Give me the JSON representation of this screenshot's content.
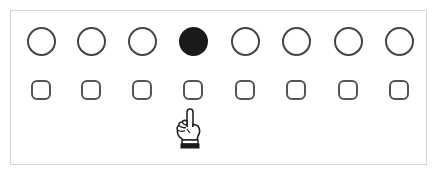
{
  "panel": {
    "border_color": "#d4d4d4"
  },
  "circles": [
    {
      "index": 0,
      "cx": 41,
      "cy": 41,
      "selected": false
    },
    {
      "index": 1,
      "cx": 91,
      "cy": 41,
      "selected": false
    },
    {
      "index": 2,
      "cx": 142,
      "cy": 41,
      "selected": false
    },
    {
      "index": 3,
      "cx": 193,
      "cy": 41,
      "selected": true
    },
    {
      "index": 4,
      "cx": 245,
      "cy": 41,
      "selected": false
    },
    {
      "index": 5,
      "cx": 296,
      "cy": 41,
      "selected": false
    },
    {
      "index": 6,
      "cx": 348,
      "cy": 41,
      "selected": false
    },
    {
      "index": 7,
      "cx": 399,
      "cy": 41,
      "selected": false
    }
  ],
  "squares": [
    {
      "index": 0,
      "cx": 41,
      "cy": 90
    },
    {
      "index": 1,
      "cx": 91,
      "cy": 90
    },
    {
      "index": 2,
      "cx": 142,
      "cy": 90
    },
    {
      "index": 3,
      "cx": 193,
      "cy": 90
    },
    {
      "index": 4,
      "cx": 245,
      "cy": 90
    },
    {
      "index": 5,
      "cx": 296,
      "cy": 90
    },
    {
      "index": 6,
      "cx": 348,
      "cy": 90
    },
    {
      "index": 7,
      "cx": 399,
      "cy": 90
    }
  ],
  "pointer": {
    "icon": "pointing-hand-icon",
    "target_square_index": 3
  },
  "colors": {
    "outline": "#444444",
    "selected_fill": "#1a1a1a",
    "background": "#ffffff"
  }
}
